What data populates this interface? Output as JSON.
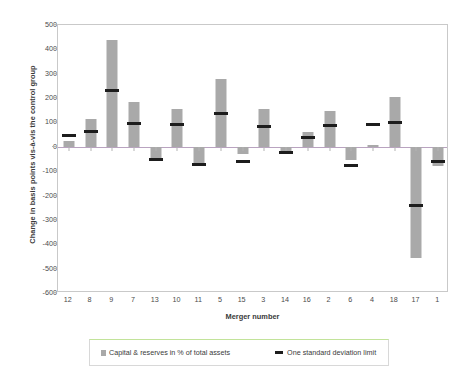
{
  "chart_data": {
    "type": "bar",
    "title": "",
    "xlabel": "Merger number",
    "ylabel": "Change in basis points vis-à-vis the control group",
    "ylim": [
      -600,
      500
    ],
    "ytick_step": 100,
    "yticks": [
      500,
      400,
      300,
      200,
      100,
      0,
      -100,
      -200,
      -300,
      -400,
      -500,
      -600
    ],
    "ytick_labels": [
      "500",
      "400",
      "300",
      "200",
      "100",
      "0",
      "-100",
      "-200",
      "-300",
      "-400",
      "-500",
      "-600"
    ],
    "grid": false,
    "legend_position": "below-plot",
    "categories": [
      "12",
      "8",
      "9",
      "7",
      "13",
      "10",
      "11",
      "5",
      "15",
      "3",
      "14",
      "16",
      "2",
      "6",
      "4",
      "18",
      "17",
      "1"
    ],
    "series": [
      {
        "name": "Capital & reserves in % of total  assets",
        "type": "bar",
        "color": "#a9a9a9",
        "values": [
          25,
          115,
          440,
          185,
          -45,
          155,
          -65,
          280,
          -30,
          155,
          -20,
          60,
          148,
          -55,
          8,
          205,
          -455,
          -80
        ]
      },
      {
        "name": "One standard  deviation limit",
        "type": "marker",
        "color": "#1d1d1d",
        "values": [
          48,
          62,
          232,
          95,
          -52,
          90,
          -72,
          135,
          -60,
          85,
          -23,
          38,
          88,
          -78,
          92,
          100,
          -240,
          -62
        ]
      }
    ]
  },
  "legend": {
    "entries": [
      {
        "label": "Capital & reserves in % of total  assets",
        "swatch": "bar-swatch"
      },
      {
        "label": "One standard  deviation limit",
        "swatch": "line-swatch"
      }
    ]
  },
  "colors": {
    "bar": "#a9a9a9",
    "marker": "#1d1d1d",
    "zero_axis": "#b9a3c0",
    "frame": "#c9c9c9",
    "legend_top_border": "#c2e39a",
    "text": "#3a3a3a"
  }
}
